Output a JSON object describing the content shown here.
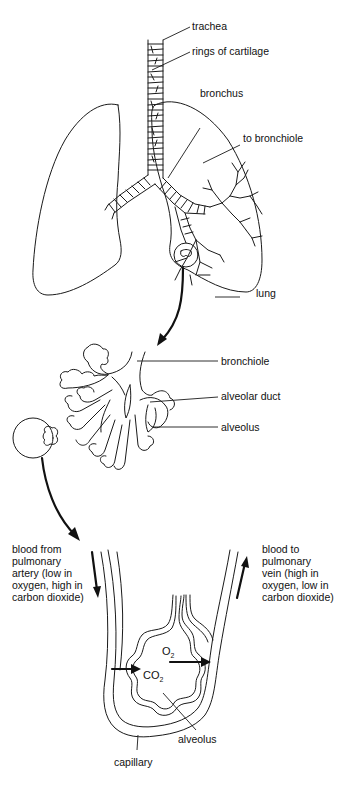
{
  "diagram": {
    "sections": [
      {
        "id": "lungs",
        "labels": {
          "trachea": "trachea",
          "rings": "rings of cartilage",
          "bronchus": "bronchus",
          "to_bronchiole": "to bronchiole",
          "lung": "lung"
        }
      },
      {
        "id": "bronchiole-detail",
        "labels": {
          "bronchiole": "bronchiole",
          "alveolar_duct": "alveolar duct",
          "alveolus": "alveolus"
        }
      },
      {
        "id": "alveolus-detail",
        "labels": {
          "artery_lines": [
            "blood from",
            "pulmonary",
            "artery (low in",
            "oxygen, high in",
            "carbon dioxide)"
          ],
          "vein_lines": [
            "blood to",
            "pulmonary",
            "vein (high in",
            "oxygen, low in",
            "carbon dioxide)"
          ],
          "o2_main": "O",
          "o2_sub": "2",
          "co2_main": "CO",
          "co2_sub": "2",
          "alveolus": "alveolus",
          "capillary": "capillary"
        }
      }
    ]
  },
  "labels": {
    "trachea": "trachea",
    "rings": "rings of cartilage",
    "bronchus": "bronchus",
    "to_bronchiole": "to bronchiole",
    "lung": "lung",
    "bronchiole": "bronchiole",
    "alveolar_duct": "alveolar duct",
    "alveolus_mid": "alveolus",
    "artery": [
      "blood from",
      "pulmonary",
      "artery (low in",
      "oxygen, high in",
      "carbon dioxide)"
    ],
    "vein": [
      "blood to",
      "pulmonary",
      "vein (high in",
      "oxygen, low in",
      "carbon dioxide)"
    ],
    "o2": "O",
    "o2_sub": "2",
    "co2": "CO",
    "co2_sub": "2",
    "alveolus_bottom": "alveolus",
    "capillary": "capillary"
  },
  "colors": {
    "ink": "#1a1a1a",
    "background": "#ffffff"
  }
}
